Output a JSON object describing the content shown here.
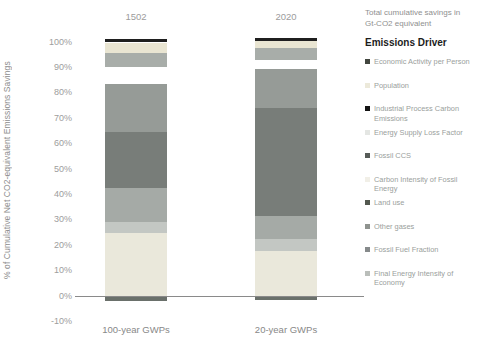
{
  "chart_data": {
    "type": "bar",
    "stacked": true,
    "ylabel": "% of Cumulative Net CO2-equivalent Emissions Savings",
    "ylim": [
      -10,
      100
    ],
    "ytick_step": 10,
    "ytick_labels": [
      "100%",
      "90%",
      "80%",
      "70%",
      "60%",
      "50%",
      "40%",
      "30%",
      "20%",
      "10%",
      "0%",
      "-10%"
    ],
    "grid": false,
    "legend_position": "right",
    "legend_note": "Total cumulative savings in Gt-CO2 equivalent",
    "legend_title": "Emissions Driver",
    "categories": [
      "100-year GWPs",
      "20-year GWPs"
    ],
    "bar_totals": [
      "1502",
      "2020"
    ],
    "series": [
      {
        "name": "Economic Activity per Person",
        "values": [
          1.5,
          1.3
        ],
        "bar_color": "#1f1f1f",
        "marker_color": "#42463f"
      },
      {
        "name": "Population",
        "values": [
          4.3,
          2.4
        ],
        "bar_color": "#e9e5d2",
        "marker_color": "#ece9da"
      },
      {
        "name": "Industrial Process Carbon Emissions",
        "values": [
          5.5,
          4.9
        ],
        "bar_color": "#a8ada9",
        "marker_color": "#141414"
      },
      {
        "name": "Energy Supply Loss Factor",
        "values": [
          6.4,
          3.7
        ],
        "bar_color": "#ffffff",
        "marker_color": "#e4e6e3"
      },
      {
        "name": "Fossil CCS",
        "values": [
          19.1,
          15.2
        ],
        "bar_color": "#969b97",
        "marker_color": "#575c58"
      },
      {
        "name": "Carbon Intensity of Fossil Energy",
        "values": [
          22.0,
          42.5
        ],
        "bar_color": "#787d79",
        "marker_color": "#f1efe7"
      },
      {
        "name": "Land use",
        "values": [
          13.4,
          9.1
        ],
        "bar_color": "#a5aaa6",
        "marker_color": "#53584f"
      },
      {
        "name": "Other gases",
        "values": [
          4.3,
          4.7
        ],
        "bar_color": "#c3c7c3",
        "marker_color": "#8f938f"
      },
      {
        "name": "Fossil Fuel Fraction",
        "values": [
          24.8,
          17.7
        ],
        "bar_color": "#eae8db",
        "marker_color": "#868a8b"
      },
      {
        "name": "Final Energy Intensity of Economy",
        "values": [
          -2.0,
          -1.6
        ],
        "bar_color": "#6a706b",
        "marker_color": "#babeba"
      }
    ]
  }
}
